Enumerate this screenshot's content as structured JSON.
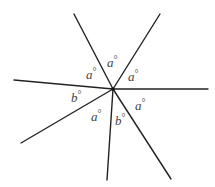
{
  "diagram": {
    "title": "",
    "center": {
      "x": 113,
      "y": 89
    },
    "rays": [
      {
        "name": "ray-upper-left",
        "x": 74,
        "y": 14
      },
      {
        "name": "ray-upper-right",
        "x": 160,
        "y": 14
      },
      {
        "name": "ray-right",
        "x": 208,
        "y": 89
      },
      {
        "name": "ray-lower-right",
        "x": 171,
        "y": 179
      },
      {
        "name": "ray-down",
        "x": 107,
        "y": 180
      },
      {
        "name": "ray-lower-left",
        "x": 21,
        "y": 143
      },
      {
        "name": "ray-left",
        "x": 14,
        "y": 80
      }
    ],
    "angle_labels": [
      {
        "name": "angle-top",
        "var": "a",
        "deg": "°",
        "x": 107,
        "y": 67
      },
      {
        "name": "angle-upper-right",
        "var": "a",
        "deg": "°",
        "x": 128,
        "y": 81
      },
      {
        "name": "angle-upper-left",
        "var": "a",
        "deg": "°",
        "x": 86,
        "y": 79
      },
      {
        "name": "angle-left",
        "var": "b",
        "deg": "°",
        "x": 71,
        "y": 102
      },
      {
        "name": "angle-lower-right",
        "var": "a",
        "deg": "°",
        "x": 135,
        "y": 110
      },
      {
        "name": "angle-lower-left",
        "var": "a",
        "deg": "°",
        "x": 91,
        "y": 121
      },
      {
        "name": "angle-lower-middle",
        "var": "b",
        "deg": "°",
        "x": 115,
        "y": 125
      }
    ]
  }
}
